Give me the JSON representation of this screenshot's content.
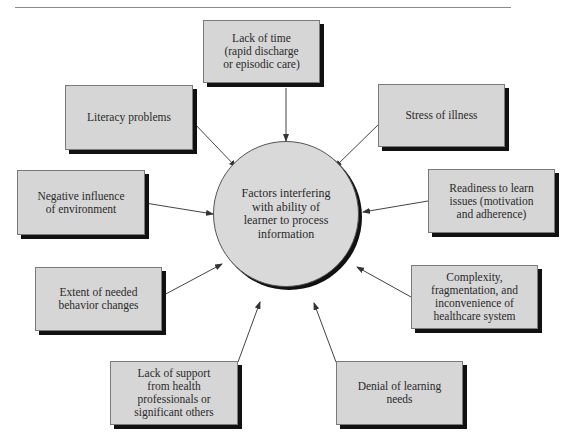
{
  "diagram": {
    "type": "hub-and-spoke",
    "center": {
      "label": "Factors interfering\nwith ability of\nlearner to process\ninformation"
    },
    "factors": [
      {
        "id": "lack-of-time",
        "label": "Lack of time\n(rapid discharge\nor episodic care)"
      },
      {
        "id": "literacy",
        "label": "Literacy problems"
      },
      {
        "id": "stress",
        "label": "Stress of illness"
      },
      {
        "id": "negative-environment",
        "label": "Negative influence\nof environment"
      },
      {
        "id": "readiness",
        "label": "Readiness to learn\nissues (motivation\nand adherence)"
      },
      {
        "id": "behavior-changes",
        "label": "Extent of needed\nbehavior changes"
      },
      {
        "id": "healthcare-complexity",
        "label": "Complexity,\nfragmentation, and\ninconvenience of\nhealthcare system"
      },
      {
        "id": "lack-of-support",
        "label": "Lack of support\nfrom health\nprofessionals or\nsignificant others"
      },
      {
        "id": "denial",
        "label": "Denial of learning\nneeds"
      }
    ],
    "edges": [
      {
        "from": "lack-of-time",
        "to": "center"
      },
      {
        "from": "literacy",
        "to": "center"
      },
      {
        "from": "stress",
        "to": "center"
      },
      {
        "from": "negative-environment",
        "to": "center"
      },
      {
        "from": "readiness",
        "to": "center"
      },
      {
        "from": "behavior-changes",
        "to": "center"
      },
      {
        "from": "healthcare-complexity",
        "to": "center"
      },
      {
        "from": "lack-of-support",
        "to": "center"
      },
      {
        "from": "denial",
        "to": "center"
      }
    ],
    "colors": {
      "box_fill": "#d6d6d6",
      "shadow": "#111111",
      "line": "#444444",
      "text": "#2a2a2a"
    }
  }
}
